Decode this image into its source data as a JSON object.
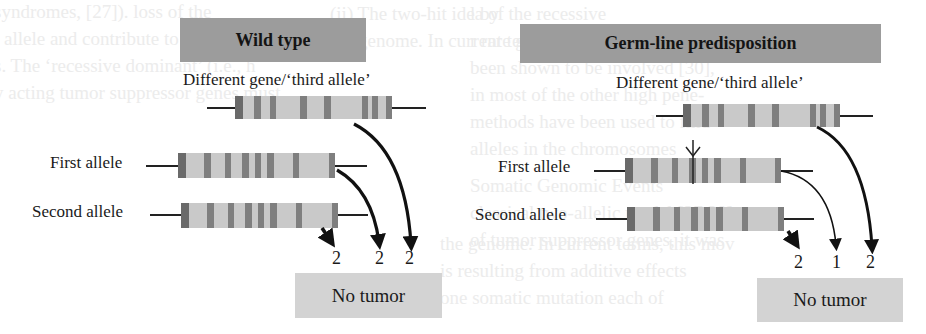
{
  "background_text": {
    "left": [
      "syndromes, [27]). loss of the",
      "l allele and contribute to a progn",
      "s. The ‘recessive dominant’ (i.e., h",
      "y acting tumor suppressor genes must",
      "ariable changes in tumor..."
    ],
    "right": [
      "l by",
      "r rare germ-line alleles",
      "been shown to be involved [30],",
      "in most of the other high pene-",
      "methods have been used to find",
      "alleles in the chromosomes",
      "Somatic Genomic Events",
      "classical two-allelic model [27,28]",
      "of tumor suppressor genes, it was"
    ],
    "middle": [
      "(ii) The two-hit idea of the recessive",
      "the genome. In current terms, this mov",
      "is resulting from additive effects",
      "one somatic mutation each of"
    ]
  },
  "panels": [
    {
      "id": "wild-type",
      "title": "Wild type",
      "third_allele_caption": "Different gene/‘third allele’",
      "first_allele_label": "First allele",
      "second_allele_label": "Second allele",
      "hit_counts": [
        "2",
        "2",
        "2"
      ],
      "outcome": "No tumor",
      "has_germline_mutation": false
    },
    {
      "id": "germ-line-predisposition",
      "title": "Germ-line predisposition",
      "third_allele_caption": "Different gene/‘third allele’",
      "first_allele_label": "First allele",
      "second_allele_label": "Second allele",
      "hit_counts": [
        "2",
        "1",
        "2"
      ],
      "outcome": "No tumor",
      "has_germline_mutation": true
    }
  ],
  "colors": {
    "header_fill": "#9c9c9c",
    "gene_fill": "#c9c9c9",
    "band_fill": "#7f7f7f",
    "outcome_fill": "#d3d3d3",
    "arrow": "#111111"
  }
}
